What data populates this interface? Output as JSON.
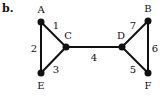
{
  "figure": {
    "label": "b.",
    "nodes": [
      {
        "id": "A",
        "x": 41,
        "y": 22,
        "lx": 41,
        "ly": 13
      },
      {
        "id": "C",
        "x": 66,
        "y": 47,
        "lx": 68,
        "ly": 39
      },
      {
        "id": "E",
        "x": 41,
        "y": 73,
        "lx": 41,
        "ly": 89
      },
      {
        "id": "D",
        "x": 122,
        "y": 47,
        "lx": 121,
        "ly": 39
      },
      {
        "id": "B",
        "x": 148,
        "y": 21,
        "lx": 148,
        "ly": 12
      },
      {
        "id": "F",
        "x": 148,
        "y": 73,
        "lx": 148,
        "ly": 89
      }
    ],
    "edges": [
      {
        "from": "A",
        "to": "C",
        "label": "1",
        "lx": 56,
        "ly": 29
      },
      {
        "from": "A",
        "to": "E",
        "label": "2",
        "lx": 34,
        "ly": 52
      },
      {
        "from": "E",
        "to": "C",
        "label": "3",
        "lx": 56,
        "ly": 73
      },
      {
        "from": "C",
        "to": "D",
        "label": "4",
        "lx": 94,
        "ly": 61
      },
      {
        "from": "D",
        "to": "F",
        "label": "5",
        "lx": 133,
        "ly": 73
      },
      {
        "from": "B",
        "to": "F",
        "label": "6",
        "lx": 155,
        "ly": 52
      },
      {
        "from": "D",
        "to": "B",
        "label": "7",
        "lx": 133,
        "ly": 29
      }
    ]
  }
}
